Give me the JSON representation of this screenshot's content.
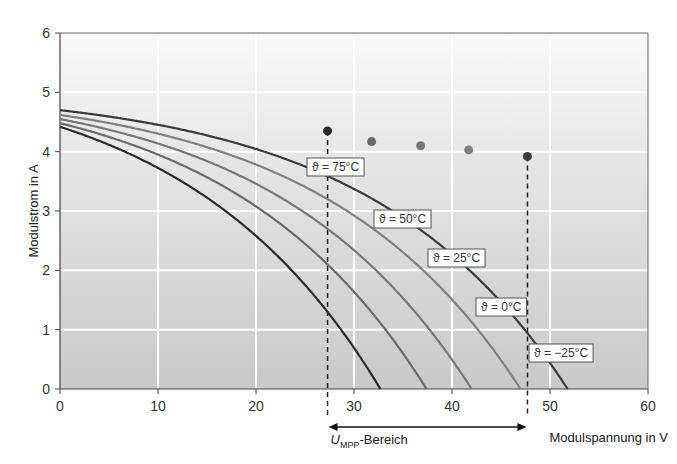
{
  "chart_data": {
    "type": "line",
    "title": "",
    "xlabel": "Modulspannung in V",
    "ylabel": "Modulstrom in A",
    "xlim": [
      0,
      60
    ],
    "ylim": [
      0,
      6
    ],
    "xticks": [
      0,
      10,
      20,
      30,
      40,
      50,
      60
    ],
    "yticks": [
      0,
      1,
      2,
      3,
      4,
      5,
      6
    ],
    "grid": true,
    "series": [
      {
        "name": "ϑ = 75°C",
        "isc": 4.42,
        "voc": 32.7,
        "mpp": [
          27.3,
          4.35
        ],
        "color": "#2a2a2a"
      },
      {
        "name": "ϑ = 50°C",
        "isc": 4.48,
        "voc": 37.4,
        "mpp": [
          31.8,
          4.17
        ],
        "color": "#6a6a6a"
      },
      {
        "name": "ϑ = 25°C",
        "isc": 4.55,
        "voc": 42.0,
        "mpp": [
          36.8,
          4.1
        ],
        "color": "#777777"
      },
      {
        "name": "ϑ = 0°C",
        "isc": 4.62,
        "voc": 47.0,
        "mpp": [
          41.7,
          4.03
        ],
        "color": "#808080"
      },
      {
        "name": "ϑ = −25°C",
        "isc": 4.7,
        "voc": 51.8,
        "mpp": [
          47.7,
          3.92
        ],
        "color": "#3a3a3a"
      }
    ],
    "annotations": {
      "mpp_range_label_main": "U",
      "mpp_range_label_sub": "MPP",
      "mpp_range_label_suffix": "-Bereich",
      "mpp_range": [
        27.3,
        47.7
      ]
    }
  }
}
